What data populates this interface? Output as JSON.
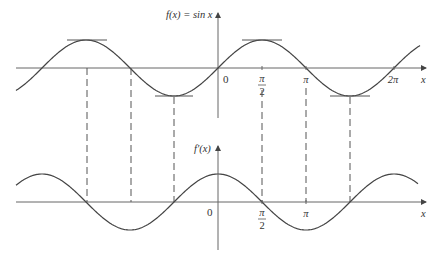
{
  "figure": {
    "top_graph": {
      "function_label": "f(x) = sin x",
      "x_axis_label": "x",
      "origin_label": "0",
      "tick_labels": [
        {
          "value": "π/2",
          "num": "π",
          "den": "2"
        },
        {
          "value": "π",
          "text": "π"
        },
        {
          "value": "2π",
          "text": "2π"
        }
      ],
      "tangent_lines": "horizontal tangents at maxima and minima"
    },
    "bottom_graph": {
      "function_label": "f′(x)",
      "x_axis_label": "x",
      "origin_label": "0",
      "tick_labels": [
        {
          "value": "π/2",
          "num": "π",
          "den": "2"
        },
        {
          "value": "π",
          "text": "π"
        }
      ]
    },
    "dashed_guides": "vertical dashed lines connecting extrema and zeros of f(x) to zeros and extrema of f′(x)",
    "colors": {
      "curve": "#444444",
      "axis": "#555555",
      "tangent": "#555555",
      "background": "#ffffff"
    }
  }
}
